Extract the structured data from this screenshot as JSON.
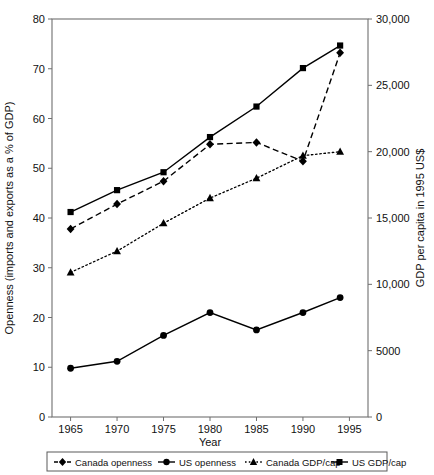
{
  "chart_data": {
    "type": "line",
    "title": "",
    "xlabel": "Year",
    "ylabel": "Openness (imports and exports as a % of GDP)",
    "y2label": "GDP per capita in 1995 US$",
    "x": [
      1965,
      1970,
      1975,
      1980,
      1985,
      1990,
      1994
    ],
    "xlim": [
      1963,
      1997
    ],
    "ylim": [
      0,
      80
    ],
    "y2lim": [
      0,
      30000
    ],
    "xticks": [
      "1965",
      "1970",
      "1975",
      "1980",
      "1985",
      "1990",
      "1995"
    ],
    "yticks": [
      "0",
      "10",
      "20",
      "30",
      "40",
      "50",
      "60",
      "70",
      "80"
    ],
    "y2ticks": [
      "0",
      "5000",
      "10,000",
      "15,000",
      "20,000",
      "25,000",
      "30,000"
    ],
    "grid": false,
    "legend_position": "bottom",
    "series": [
      {
        "name": "Canada openness",
        "axis": "left",
        "marker": "diamond",
        "linestyle": "dashed",
        "color": "#000000",
        "values": [
          37.8,
          42.8,
          47.4,
          54.8,
          55.2,
          51.4,
          73.2
        ]
      },
      {
        "name": "US openness",
        "axis": "left",
        "marker": "circle",
        "linestyle": "solid",
        "color": "#000000",
        "values": [
          9.8,
          11.2,
          16.4,
          21.0,
          17.5,
          21.0,
          24.0
        ]
      },
      {
        "name": "Canada GDP/cap",
        "axis": "right",
        "marker": "triangle",
        "linestyle": "dotted",
        "color": "#000000",
        "values": [
          10900,
          12500,
          14600,
          16500,
          18000,
          19700,
          20000
        ]
      },
      {
        "name": "US GDP/cap",
        "axis": "right",
        "marker": "square",
        "linestyle": "solid",
        "color": "#000000",
        "values": [
          15450,
          17100,
          18450,
          21100,
          23400,
          26300,
          28000
        ]
      }
    ]
  },
  "legend": {
    "items": [
      {
        "label": "Canada openness",
        "marker": "diamond",
        "linestyle": "dashed"
      },
      {
        "label": "US openness",
        "marker": "circle",
        "linestyle": "solid"
      },
      {
        "label": "Canada GDP/cap",
        "marker": "triangle",
        "linestyle": "dotted"
      },
      {
        "label": "US GDP/cap",
        "marker": "square",
        "linestyle": "solid"
      }
    ]
  }
}
